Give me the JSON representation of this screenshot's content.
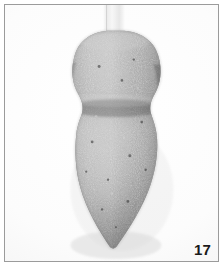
{
  "plate": {
    "figure_number": "17",
    "frame_color": "#9b9b9b",
    "background_color": "#ffffff",
    "photo_background_color": "#fbfbfb"
  },
  "subject": {
    "name": "stone-artifact",
    "description": "gray granular stone object with bulbous head, pinched waist and pointed conical base",
    "body_color": "#7c7c7c",
    "highlight_color": "#a9a9a9",
    "shadow_color": "#4a4a4a",
    "mount_color": "#ededed"
  }
}
